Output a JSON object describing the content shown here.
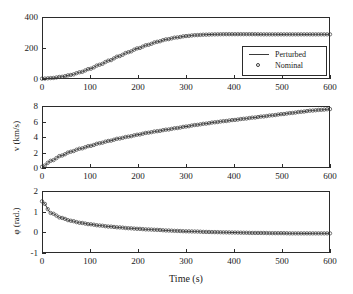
{
  "figure": {
    "xlabel": "Time (s)",
    "legend": {
      "position": "top-panel-lower-right",
      "entries": [
        {
          "label": "Perturbed",
          "marker": "line"
        },
        {
          "label": "Nominal",
          "marker": "circle"
        }
      ]
    }
  },
  "chart_data": [
    {
      "type": "line",
      "panel": "top",
      "title": "",
      "xlabel": "",
      "ylabel": "",
      "xlim": [
        0,
        600
      ],
      "ylim": [
        0,
        400
      ],
      "xticks": [
        0,
        100,
        200,
        300,
        400,
        500,
        600
      ],
      "yticks": [
        0,
        200,
        400
      ],
      "xtick_labels": [
        "0",
        "100",
        "200",
        "300",
        "400",
        "500",
        "600"
      ],
      "ytick_labels": [
        "0",
        "200",
        "400"
      ],
      "grid": false,
      "legend": [
        "Perturbed",
        "Nominal"
      ],
      "x": [
        0,
        20,
        40,
        60,
        80,
        100,
        120,
        140,
        160,
        180,
        200,
        220,
        240,
        260,
        280,
        300,
        320,
        340,
        360,
        380,
        400,
        420,
        440,
        460,
        480,
        500,
        520,
        540,
        560,
        580,
        600
      ],
      "series": [
        {
          "name": "Perturbed",
          "values": [
            2,
            6,
            14,
            26,
            44,
            66,
            92,
            119,
            147,
            173,
            198,
            220,
            240,
            256,
            268,
            277,
            283,
            286,
            288,
            289,
            289,
            289,
            289,
            288,
            288,
            288,
            288,
            288,
            288,
            288,
            288
          ]
        },
        {
          "name": "Nominal",
          "values": [
            2,
            6,
            14,
            26,
            44,
            66,
            92,
            119,
            147,
            173,
            198,
            220,
            240,
            256,
            268,
            277,
            283,
            286,
            288,
            289,
            289,
            289,
            289,
            288,
            288,
            288,
            288,
            288,
            288,
            288,
            288
          ]
        }
      ]
    },
    {
      "type": "line",
      "panel": "middle",
      "title": "",
      "xlabel": "",
      "ylabel": "v (km/s)",
      "xlim": [
        0,
        600
      ],
      "ylim": [
        0,
        8
      ],
      "xticks": [
        0,
        100,
        200,
        300,
        400,
        500,
        600
      ],
      "yticks": [
        0,
        2,
        4,
        6,
        8
      ],
      "xtick_labels": [
        "0",
        "100",
        "200",
        "300",
        "400",
        "500",
        "600"
      ],
      "ytick_labels": [
        "0",
        "2",
        "4",
        "6",
        "8"
      ],
      "grid": false,
      "x": [
        0,
        20,
        40,
        60,
        80,
        100,
        120,
        140,
        160,
        180,
        200,
        220,
        240,
        260,
        280,
        300,
        320,
        340,
        360,
        380,
        400,
        420,
        440,
        460,
        480,
        500,
        520,
        540,
        560,
        580,
        600
      ],
      "series": [
        {
          "name": "Perturbed",
          "values": [
            0.15,
            0.95,
            1.6,
            2.1,
            2.5,
            2.85,
            3.2,
            3.5,
            3.8,
            4.05,
            4.3,
            4.55,
            4.75,
            4.95,
            5.15,
            5.35,
            5.55,
            5.72,
            5.9,
            6.05,
            6.2,
            6.35,
            6.5,
            6.65,
            6.8,
            6.95,
            7.1,
            7.25,
            7.4,
            7.5,
            7.6
          ]
        },
        {
          "name": "Nominal",
          "values": [
            0.15,
            0.95,
            1.6,
            2.1,
            2.5,
            2.85,
            3.2,
            3.5,
            3.8,
            4.05,
            4.3,
            4.55,
            4.75,
            4.95,
            5.15,
            5.35,
            5.55,
            5.72,
            5.9,
            6.05,
            6.2,
            6.35,
            6.5,
            6.65,
            6.8,
            6.95,
            7.1,
            7.25,
            7.4,
            7.5,
            7.6
          ]
        }
      ]
    },
    {
      "type": "line",
      "panel": "bottom",
      "title": "",
      "xlabel": "Time (s)",
      "ylabel": "φ (rad.)",
      "xlim": [
        0,
        600
      ],
      "ylim": [
        -1,
        2
      ],
      "xticks": [
        0,
        100,
        200,
        300,
        400,
        500,
        600
      ],
      "yticks": [
        -1,
        0,
        1,
        2
      ],
      "xtick_labels": [
        "0",
        "100",
        "200",
        "300",
        "400",
        "500",
        "600"
      ],
      "ytick_labels": [
        "-1",
        "0",
        "1",
        "2"
      ],
      "grid": false,
      "x": [
        0,
        20,
        40,
        60,
        80,
        100,
        120,
        140,
        160,
        180,
        200,
        220,
        240,
        260,
        280,
        300,
        320,
        340,
        360,
        380,
        400,
        420,
        440,
        460,
        480,
        500,
        520,
        540,
        560,
        580,
        600
      ],
      "series": [
        {
          "name": "Perturbed",
          "values": [
            1.5,
            0.92,
            0.7,
            0.56,
            0.46,
            0.39,
            0.33,
            0.28,
            0.24,
            0.2,
            0.17,
            0.14,
            0.12,
            0.09,
            0.07,
            0.05,
            0.04,
            0.02,
            0.01,
            0.0,
            -0.01,
            -0.02,
            -0.03,
            -0.03,
            -0.04,
            -0.04,
            -0.05,
            -0.05,
            -0.05,
            -0.05,
            -0.05
          ]
        },
        {
          "name": "Nominal",
          "values": [
            1.5,
            0.92,
            0.7,
            0.56,
            0.46,
            0.39,
            0.33,
            0.28,
            0.24,
            0.2,
            0.17,
            0.14,
            0.12,
            0.09,
            0.07,
            0.05,
            0.04,
            0.02,
            0.01,
            0.0,
            -0.01,
            -0.02,
            -0.03,
            -0.03,
            -0.04,
            -0.04,
            -0.05,
            -0.05,
            -0.05,
            -0.05,
            -0.05
          ]
        }
      ]
    }
  ],
  "colors": {
    "line": "#3a3a3a",
    "marker_edge": "#3a3a3a",
    "axis": "#2b2b2b",
    "background": "#ffffff"
  }
}
